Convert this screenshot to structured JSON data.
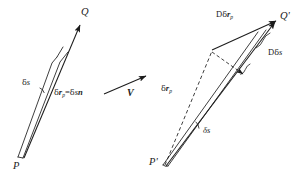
{
  "figure": {
    "background_color": "#ffffff",
    "stroke_color": "#1c1c1c",
    "left_diagram": {
      "name": "undeformed-configuration",
      "point_start_label": "P",
      "point_end_label": "Q",
      "arc_length_label_html": "δs",
      "displacement_label_parts": {
        "lead": "δ",
        "vector": "r",
        "subscript": "p",
        "equals": "=",
        "rhs_delta": "δ",
        "rhs_s": "s",
        "rhs_n": "n"
      }
    },
    "middle_arrow": {
      "name": "deformation-map-arrow",
      "label": "V"
    },
    "right_diagram": {
      "name": "deformed-configuration",
      "point_start_label": "P'",
      "point_end_label": "Q'",
      "arc_length_label": "δs",
      "displacement_label": {
        "lead": "δ",
        "vector": "r",
        "subscript": "p"
      },
      "rate_displacement_label": {
        "operator": "D",
        "lead": "δ",
        "vector": "r",
        "subscript": "p"
      },
      "rate_arc_label": {
        "operator": "D",
        "lead": "δ",
        "s": "s"
      }
    }
  }
}
